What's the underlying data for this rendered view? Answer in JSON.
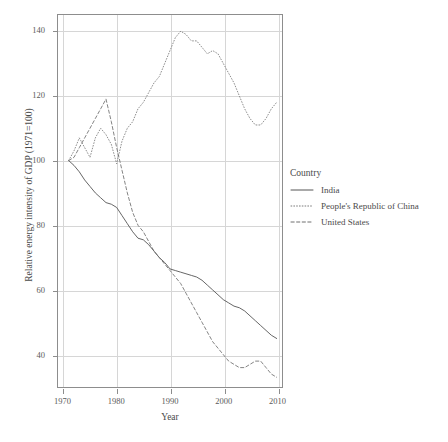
{
  "chart_data": {
    "type": "line",
    "title": "",
    "xlabel": "Year",
    "ylabel": "Relative energy intensity of GDP (1971=100)",
    "xlim": [
      1969,
      2011
    ],
    "ylim": [
      30,
      145
    ],
    "xticks": [
      1970,
      1980,
      1990,
      2000,
      2010
    ],
    "yticks": [
      40,
      60,
      80,
      100,
      120,
      140
    ],
    "grid": true,
    "legend_position": "right",
    "legend_title": "Country",
    "series": [
      {
        "name": "India",
        "style": "solid",
        "color": "#555555",
        "x": [
          1971,
          1972,
          1973,
          1974,
          1975,
          1976,
          1977,
          1978,
          1979,
          1980,
          1981,
          1982,
          1983,
          1984,
          1985,
          1986,
          1987,
          1988,
          1989,
          1990,
          1991,
          1992,
          1993,
          1994,
          1995,
          1996,
          1997,
          1998,
          1999,
          2000,
          2001,
          2002,
          2003,
          2004,
          2005,
          2006,
          2007,
          2008,
          2009,
          2010
        ],
        "values": [
          100,
          98.5,
          96.5,
          94,
          92,
          90,
          88.5,
          87,
          86.5,
          85.5,
          83,
          80.5,
          78,
          76,
          75.5,
          74,
          72,
          70,
          68.5,
          66.5,
          66,
          65.5,
          65,
          64.5,
          64,
          63,
          61.5,
          60,
          58.5,
          57,
          56,
          55,
          54.5,
          53.5,
          52,
          50.5,
          49,
          47.5,
          46,
          45
        ]
      },
      {
        "name": "People's Republic of China",
        "style": "dotted",
        "color": "#7a7a7a",
        "x": [
          1971,
          1972,
          1973,
          1974,
          1975,
          1976,
          1977,
          1978,
          1979,
          1980,
          1981,
          1982,
          1983,
          1984,
          1985,
          1986,
          1987,
          1988,
          1989,
          1990,
          1991,
          1992,
          1993,
          1994,
          1995,
          1996,
          1997,
          1998,
          1999,
          2000,
          2001,
          2002,
          2003,
          2004,
          2005,
          2006,
          2007,
          2008,
          2009,
          2010
        ],
        "values": [
          100,
          103,
          107,
          104,
          101,
          107,
          110,
          108,
          105,
          99,
          106,
          110,
          112,
          116,
          118,
          121,
          124,
          126,
          130,
          134,
          138,
          140,
          139,
          137,
          137,
          135,
          133,
          134,
          133,
          130,
          127,
          124,
          120,
          116,
          113,
          111,
          111,
          113,
          116,
          118
        ]
      },
      {
        "name": "United States",
        "style": "dashed",
        "color": "#6e6e6e",
        "x": [
          1971,
          1972,
          1973,
          1974,
          1975,
          1976,
          1977,
          1978,
          1979,
          1980,
          1981,
          1982,
          1983,
          1984,
          1985,
          1986,
          1987,
          1988,
          1989,
          1990,
          1991,
          1992,
          1993,
          1994,
          1995,
          1996,
          1997,
          1998,
          1999,
          2000,
          2001,
          2002,
          2003,
          2004,
          2005,
          2006,
          2007,
          2008,
          2009,
          2010
        ],
        "values": [
          100,
          101,
          104,
          107,
          110,
          113,
          116,
          119,
          112,
          104,
          97,
          90,
          84,
          80,
          78,
          75,
          72,
          70,
          68,
          66,
          64,
          62,
          59,
          56,
          53,
          50,
          47,
          44,
          42,
          40,
          38,
          37,
          36,
          36,
          37,
          38,
          38,
          36,
          34,
          33
        ]
      }
    ]
  },
  "axes": {
    "x_title": "Year",
    "y_title": "Relative energy intensity of GDP (1971=100)",
    "x_tick_labels": [
      "1970",
      "1980",
      "1990",
      "2000",
      "2010"
    ],
    "y_tick_labels": [
      "40",
      "60",
      "80",
      "100",
      "120",
      "140"
    ]
  },
  "legend": {
    "title": "Country",
    "entries": [
      {
        "label": "India",
        "style": "solid"
      },
      {
        "label": "People's Republic of China",
        "style": "dotted"
      },
      {
        "label": "United States",
        "style": "dashed"
      }
    ]
  }
}
